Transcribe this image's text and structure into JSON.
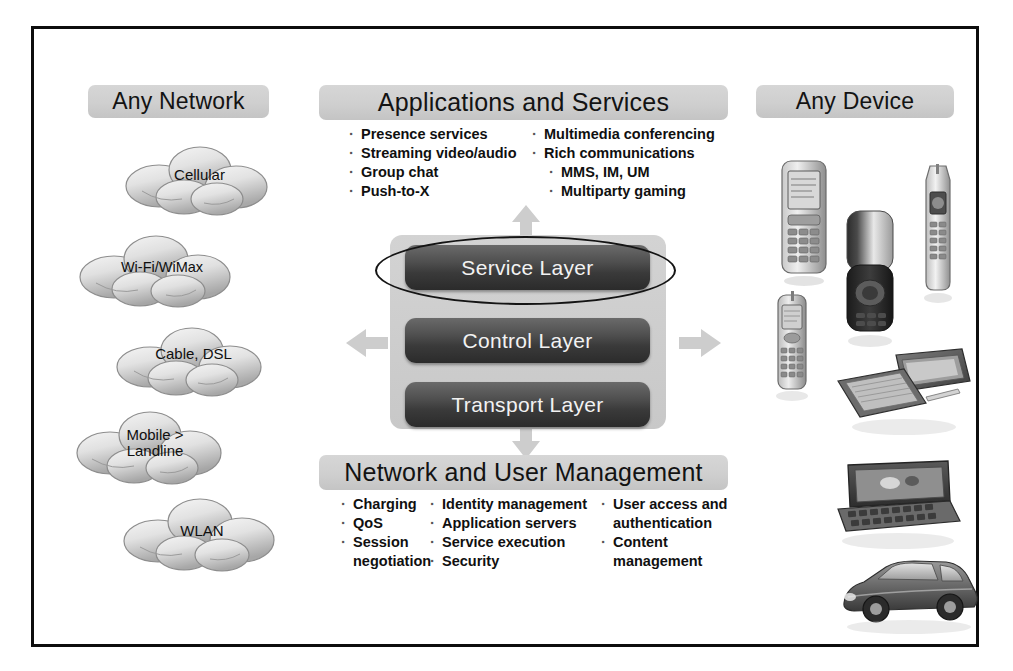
{
  "frame": {
    "border_color": "#0d0d0d",
    "background": "#ffffff"
  },
  "theme": {
    "pill_gray": "#cfcfcf",
    "panel_gray": "#cdcdcd",
    "layer_dark": "#3a3a3a",
    "layer_text": "#f2f2f2",
    "arrow_gray": "#c9c9c9",
    "text_black": "#101010"
  },
  "left_column": {
    "title": "Any Network",
    "clouds": [
      {
        "label": "Cellular",
        "lines": [
          "Cellular"
        ]
      },
      {
        "label": "Wi-Fi/WiMax",
        "lines": [
          "Wi-Fi/WiMax"
        ]
      },
      {
        "label": "Cable, DSL",
        "lines": [
          "Cable, DSL"
        ]
      },
      {
        "label": "Mobile > Landline",
        "lines": [
          "Mobile >",
          "Landline"
        ]
      },
      {
        "label": "WLAN",
        "lines": [
          "WLAN"
        ]
      }
    ]
  },
  "center": {
    "applications": {
      "title": "Applications and Services",
      "column_1": [
        {
          "text": "Presence services",
          "level": 1
        },
        {
          "text": "Streaming video/audio",
          "level": 1
        },
        {
          "text": "Group chat",
          "level": 1
        },
        {
          "text": "Push-to-X",
          "level": 1
        }
      ],
      "column_2": [
        {
          "text": "Multimedia conferencing",
          "level": 1
        },
        {
          "text": "Rich communications",
          "level": 1
        },
        {
          "text": "MMS, IM, UM",
          "level": 2
        },
        {
          "text": "Multiparty gaming",
          "level": 2
        }
      ]
    },
    "layers": [
      {
        "name": "Service Layer",
        "highlighted": true
      },
      {
        "name": "Control Layer",
        "highlighted": false
      },
      {
        "name": "Transport Layer",
        "highlighted": false
      }
    ],
    "arrows": [
      "up",
      "down",
      "left",
      "right"
    ],
    "management": {
      "title": "Network and User Management",
      "column_1": [
        {
          "text": "Charging",
          "level": 1
        },
        {
          "text": "QoS",
          "level": 1
        },
        {
          "text": "Session",
          "level": 1
        },
        {
          "text": "negotiation",
          "level": 0
        }
      ],
      "column_2": [
        {
          "text": "Identity management",
          "level": 1
        },
        {
          "text": "Application servers",
          "level": 1
        },
        {
          "text": "Service execution",
          "level": 1
        },
        {
          "text": "Security",
          "level": 1
        }
      ],
      "column_3": [
        {
          "text": "User access and",
          "level": 1
        },
        {
          "text": "authentication",
          "level": 0
        },
        {
          "text": "Content",
          "level": 1
        },
        {
          "text": "management",
          "level": 0
        }
      ]
    }
  },
  "right_column": {
    "title": "Any Device",
    "devices": [
      {
        "name": "candybar-phone"
      },
      {
        "name": "flip-phone"
      },
      {
        "name": "slim-bar-phone"
      },
      {
        "name": "compact-phone"
      },
      {
        "name": "pda-organizer"
      },
      {
        "name": "laptop-computer"
      },
      {
        "name": "car-vehicle"
      }
    ]
  }
}
